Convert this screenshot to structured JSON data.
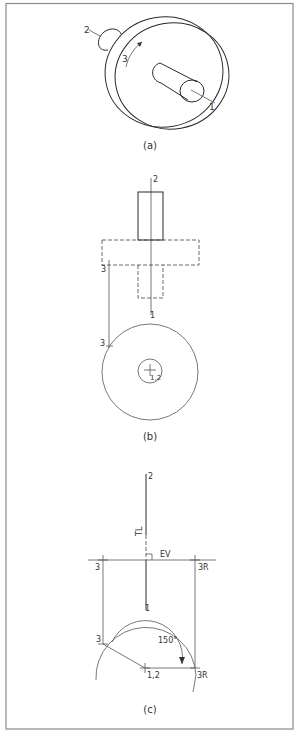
{
  "figure": {
    "border_color": "#8a8a8a",
    "views": [
      {
        "id": "a",
        "caption": "(a)",
        "description": "Pictorial view of disc with shaft and knob",
        "labels": {
          "p1": "1",
          "p2": "2",
          "p3": "3"
        }
      },
      {
        "id": "b",
        "caption": "(b)",
        "description": "Front view and circular end view",
        "labels": {
          "p2_top": "2",
          "p1_bottom": "1",
          "p3_front": "3",
          "p3_end": "3",
          "center": "1,2"
        }
      },
      {
        "id": "c",
        "caption": "(c)",
        "description": "Revolution of point 3 about axis 1-2",
        "labels": {
          "p2": "2",
          "p1": "1",
          "tl": "TL",
          "ev": "EV",
          "p3_left": "3",
          "p3r_top": "3R",
          "p3_arc": "3",
          "center": "1,2",
          "angle": "150°",
          "p3r_arc": "3R"
        }
      }
    ]
  }
}
